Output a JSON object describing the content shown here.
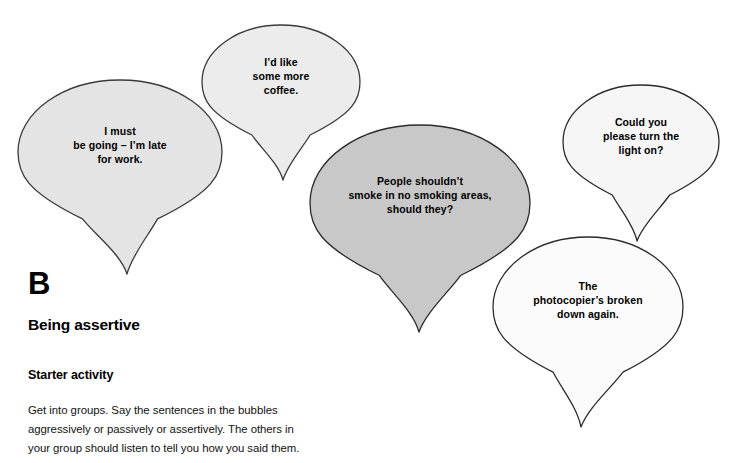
{
  "page": {
    "background_color": "#ffffff",
    "text_color": "#000000"
  },
  "bubbles": [
    {
      "id": "bubble-i-must-be-going",
      "name": "speech-bubble-i-must-be-going",
      "text": "I must\nbe going – I’m late\nfor work.",
      "lines": [
        "I must",
        "be going – I’m late",
        "for work."
      ],
      "fill": "#e4e4e4",
      "stroke": "#3a3a3a",
      "cx": 120,
      "cy": 152,
      "rx": 102,
      "ry": 72,
      "tail_tip_x": 127,
      "tail_tip_y": 274
    },
    {
      "id": "bubble-id-like-some-more-coffee",
      "name": "speech-bubble-id-like-some-more-coffee",
      "text": "I’d like\nsome more\ncoffee.",
      "lines": [
        "I’d like",
        "some more",
        "coffee."
      ],
      "fill": "#ececec",
      "stroke": "#3a3a3a",
      "cx": 281,
      "cy": 82,
      "rx": 79,
      "ry": 57,
      "tail_tip_x": 283,
      "tail_tip_y": 180
    },
    {
      "id": "bubble-people-shouldnt-smoke",
      "name": "speech-bubble-people-shouldnt-smoke",
      "text": "People shouldn’t\nsmoke in no smoking areas,\nshould they?",
      "lines": [
        "People shouldn’t",
        "smoke in no smoking areas,",
        "should they?"
      ],
      "fill": "#c8c8c8",
      "stroke": "#2b2b2b",
      "cx": 420,
      "cy": 203,
      "rx": 110,
      "ry": 78,
      "tail_tip_x": 419,
      "tail_tip_y": 332
    },
    {
      "id": "bubble-could-you-please-turn-the-light-on",
      "name": "speech-bubble-could-you-please-turn-the-light-on",
      "text": "Could you\nplease turn the\nlight on?",
      "lines": [
        "Could you",
        "please turn the",
        "light on?"
      ],
      "fill": "#f6f6f6",
      "stroke": "#2b2b2b",
      "cx": 641,
      "cy": 142,
      "rx": 78,
      "ry": 57,
      "tail_tip_x": 637,
      "tail_tip_y": 241
    },
    {
      "id": "bubble-the-photocopiers-broken-down-again",
      "name": "speech-bubble-the-photocopiers-broken-down-again",
      "text": "The\nphotocopier’s broken\ndown again.",
      "lines": [
        "The",
        "photocopier’s broken",
        "down again."
      ],
      "fill": "#fbfbfb",
      "stroke": "#2b2b2b",
      "cx": 588,
      "cy": 307,
      "rx": 95,
      "ry": 70,
      "tail_tip_x": 581,
      "tail_tip_y": 427
    }
  ],
  "content": {
    "unit_letter": "B",
    "unit_title": "Being assertive",
    "section_heading": "Starter activity",
    "paragraph_lines": [
      "Get into groups. Say the sentences in the bubbles",
      "aggressively or passively or assertively. The others in",
      "your group should listen to tell you how you said them."
    ]
  }
}
